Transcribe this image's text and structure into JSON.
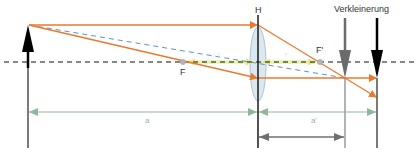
{
  "diagram": {
    "title_label": "Verkleinerung",
    "principal_plane_label": "H",
    "focal_point_label": "F",
    "focal_point_image_label": "F'",
    "object_distance_label": "a",
    "image_distance_label": "a'",
    "focal_length_label_left": "f",
    "focal_length_label_right": "f'"
  },
  "colors": {
    "ray": "#e87a2e",
    "dashed_ray": "#5b93c7",
    "optical_axis": "#111111",
    "object_arrow": "#000000",
    "image_arrow_gray": "#6b6b6b",
    "image_arrow_black": "#000000",
    "lens_fill": "#dbe8f0",
    "lens_stroke": "#9fb6c6",
    "focal_arrow": "#e9f0a8",
    "dimension_green": "#8fb89a",
    "dimension_gray": "#6f6f6f",
    "focal_point": "#b5b5b5"
  },
  "geometry": {
    "optical_axis_y": 62,
    "object_x": 28,
    "lens_x": 258,
    "focus_left_x": 183,
    "focus_right_x": 320,
    "image_gray_x": 345,
    "image_black_x": 377
  }
}
